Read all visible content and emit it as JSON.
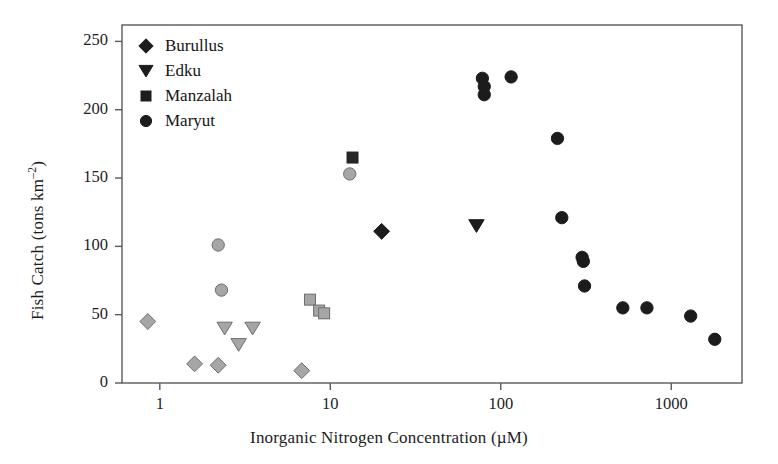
{
  "chart_data": {
    "type": "scatter",
    "title": "",
    "xlabel": "Inorganic Nitrogen Concentration (µM)",
    "ylabel": "Fish Catch (tons km⁻²)",
    "xscale": "log",
    "yscale": "linear",
    "xlim": [
      0.6,
      2600
    ],
    "ylim": [
      0,
      262
    ],
    "xticks": [
      1,
      10,
      100,
      1000
    ],
    "xticklabels": [
      "1",
      "10",
      "100",
      "1000"
    ],
    "yticks": [
      0,
      50,
      100,
      150,
      200,
      250
    ],
    "yticklabels": [
      "0",
      "50",
      "100",
      "150",
      "200",
      "250"
    ],
    "grid": false,
    "legend_position": "top-left",
    "series": [
      {
        "name": "Burullus",
        "marker": "diamond",
        "color": "#1c1c1c",
        "points": [
          [
            20,
            111
          ]
        ]
      },
      {
        "name": "Burullus (light)",
        "marker": "diamond",
        "color": "#a6a6a6",
        "points": [
          [
            0.85,
            45
          ],
          [
            1.6,
            14
          ],
          [
            2.2,
            13
          ],
          [
            6.8,
            9
          ]
        ]
      },
      {
        "name": "Edku",
        "marker": "triangle-down",
        "color": "#1c1c1c",
        "points": [
          [
            72,
            115
          ]
        ]
      },
      {
        "name": "Edku (light)",
        "marker": "triangle-down",
        "color": "#a6a6a6",
        "points": [
          [
            2.4,
            40
          ],
          [
            2.9,
            28
          ],
          [
            3.5,
            40
          ]
        ]
      },
      {
        "name": "Manzalah",
        "marker": "square",
        "color": "#262626",
        "points": [
          [
            13.5,
            165
          ]
        ]
      },
      {
        "name": "Manzalah (light)",
        "marker": "square",
        "color": "#a6a6a6",
        "points": [
          [
            7.6,
            61
          ],
          [
            8.6,
            53
          ],
          [
            9.2,
            51
          ]
        ]
      },
      {
        "name": "Maryut",
        "marker": "circle",
        "color": "#1c1c1c",
        "points": [
          [
            78,
            223
          ],
          [
            80,
            217
          ],
          [
            80,
            211
          ],
          [
            115,
            224
          ],
          [
            215,
            179
          ],
          [
            228,
            121
          ],
          [
            300,
            92
          ],
          [
            305,
            89
          ],
          [
            310,
            71
          ],
          [
            520,
            55
          ],
          [
            720,
            55
          ],
          [
            1300,
            49
          ],
          [
            1800,
            32
          ]
        ]
      },
      {
        "name": "Maryut (light)",
        "marker": "circle",
        "color": "#a6a6a6",
        "points": [
          [
            2.2,
            101
          ],
          [
            2.3,
            68
          ],
          [
            13,
            153
          ]
        ]
      }
    ],
    "legend_entries": [
      {
        "label": "Burullus",
        "marker": "diamond"
      },
      {
        "label": "Edku",
        "marker": "triangle-down"
      },
      {
        "label": "Manzalah",
        "marker": "square"
      },
      {
        "label": "Maryut",
        "marker": "circle"
      }
    ]
  },
  "axes": {
    "x_label": "Inorganic Nitrogen Concentration (µM)",
    "y_label_main": "Fish Catch (tons km",
    "y_label_sup": "–2",
    "y_label_tail": ")"
  },
  "colors": {
    "dark_marker": "#1c1c1c",
    "light_marker": "#a6a6a6",
    "marker_edge": "#6e6e6e",
    "axis": "#5a5a5a",
    "text": "#1c1c1c",
    "background": "#ffffff"
  }
}
